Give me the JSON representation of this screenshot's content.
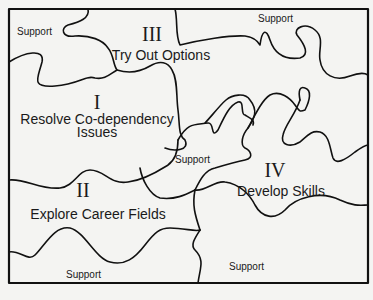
{
  "diagram": {
    "type": "puzzle-region-map",
    "border_color": "#111111",
    "background": "#f4f4f2",
    "regions": [
      {
        "numeral": "I",
        "title_line1": "Resolve Co-dependency",
        "title_line2": "Issues"
      },
      {
        "numeral": "II",
        "title_line1": "Explore Career Fields"
      },
      {
        "numeral": "III",
        "title_line1": "Try Out Options"
      },
      {
        "numeral": "IV",
        "title_line1": "Develop Skills"
      }
    ],
    "support_labels": [
      "Support",
      "Support",
      "Support",
      "Support",
      "Support"
    ]
  }
}
